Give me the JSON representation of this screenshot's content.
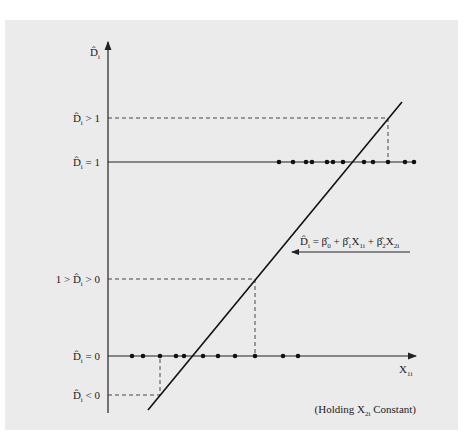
{
  "diagram": {
    "y_axis_label": "D̂i",
    "x_axis_label": "X1i",
    "y_levels": [
      {
        "label": "D̂i > 1",
        "style": "dashed"
      },
      {
        "label": "D̂i = 1",
        "style": "solid"
      },
      {
        "label": "1 > D̂i > 0",
        "style": "dashed"
      },
      {
        "label": "D̂i = 0",
        "style": "axis"
      },
      {
        "label": "D̂i < 0",
        "style": "dashed"
      }
    ],
    "equation": "D̂i = β̂0 + β̂1X1i + β̂2X2i",
    "note": "(Holding X2i Constant)",
    "data_points_at_1_count": 13,
    "data_points_at_0_count": 12
  }
}
